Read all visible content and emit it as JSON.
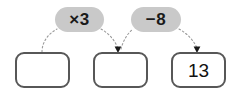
{
  "diagram": {
    "type": "function-machine",
    "title": "",
    "operations": [
      {
        "id": "op1",
        "label": "×3",
        "operator": "multiply",
        "operand": 3
      },
      {
        "id": "op2",
        "label": "−8",
        "operator": "subtract",
        "operand": 8
      }
    ],
    "boxes": [
      {
        "id": "box1",
        "value": "",
        "filled": false
      },
      {
        "id": "box2",
        "value": "",
        "filled": false
      },
      {
        "id": "box3",
        "value": "13",
        "filled": true
      }
    ],
    "colors": {
      "pill_fill": "#c9c9c9",
      "pill_text": "#1a1a1a",
      "box_border": "#575757",
      "box_fill": "#ffffff",
      "box_text": "#111111",
      "connector": "#9a9a9a",
      "arrowhead": "#1a1a1a",
      "background": "#ffffff"
    }
  }
}
